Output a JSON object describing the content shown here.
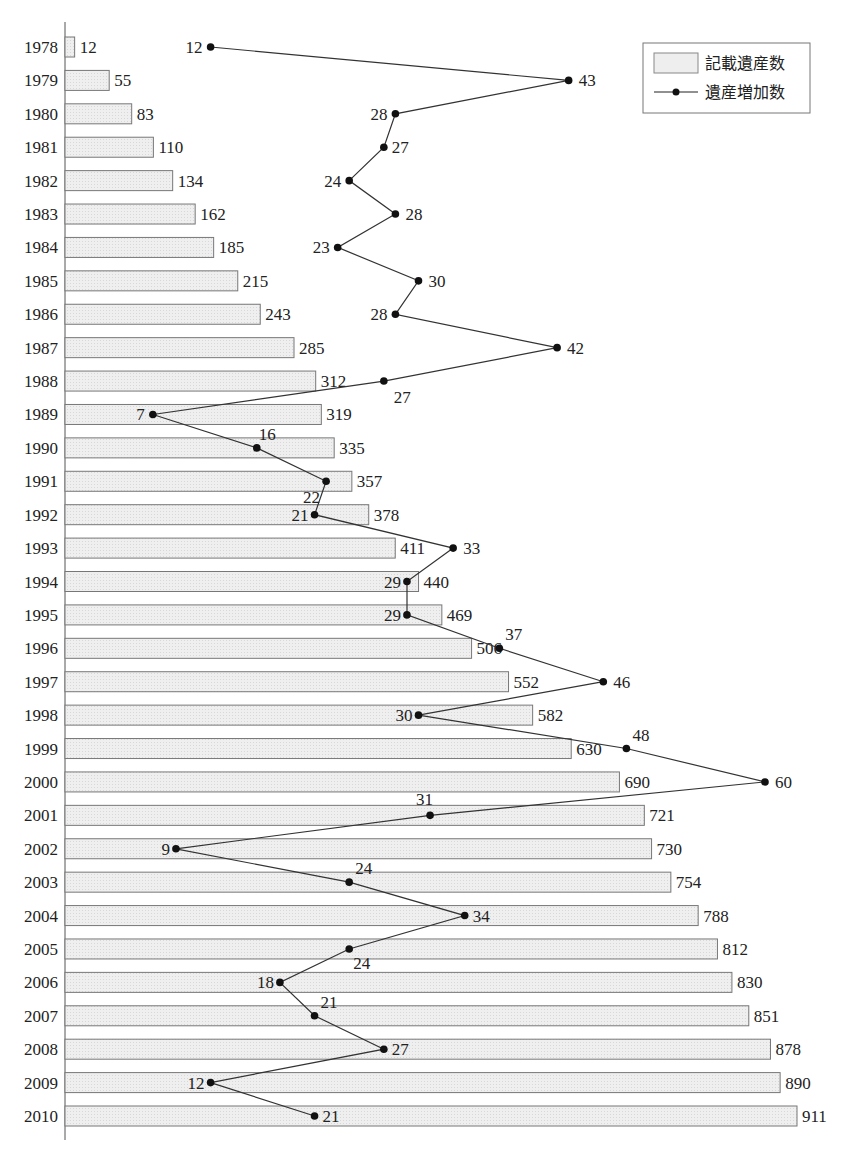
{
  "chart_data": {
    "type": "bar",
    "orientation": "horizontal",
    "title": "",
    "xlabel": "",
    "ylabel": "",
    "categories": [
      "1978",
      "1979",
      "1980",
      "1981",
      "1982",
      "1983",
      "1984",
      "1985",
      "1986",
      "1987",
      "1988",
      "1989",
      "1990",
      "1991",
      "1992",
      "1993",
      "1994",
      "1995",
      "1996",
      "1997",
      "1998",
      "1999",
      "2000",
      "2001",
      "2002",
      "2003",
      "2004",
      "2005",
      "2006",
      "2007",
      "2008",
      "2009",
      "2010"
    ],
    "series": [
      {
        "name": "記載遺産数",
        "type": "bar",
        "color": "#eeeeee",
        "values": [
          12,
          55,
          83,
          110,
          134,
          162,
          185,
          215,
          243,
          285,
          312,
          319,
          335,
          357,
          378,
          411,
          440,
          469,
          506,
          552,
          582,
          630,
          690,
          721,
          730,
          754,
          788,
          812,
          830,
          851,
          878,
          890,
          911
        ]
      },
      {
        "name": "遺産増加数",
        "type": "line",
        "color": "#111111",
        "values": [
          12,
          43,
          28,
          27,
          24,
          28,
          23,
          30,
          28,
          42,
          27,
          7,
          16,
          22,
          21,
          33,
          29,
          29,
          37,
          46,
          30,
          48,
          60,
          31,
          9,
          24,
          34,
          24,
          18,
          21,
          27,
          12,
          21
        ]
      }
    ],
    "legend": {
      "position": "top-right",
      "entries": [
        "記載遺産数",
        "遺産増加数"
      ]
    },
    "grid": false,
    "xlim_bar": [
      0,
      911
    ],
    "xlim_line": [
      0,
      60
    ]
  }
}
